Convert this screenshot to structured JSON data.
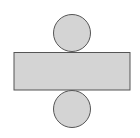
{
  "diagram": {
    "colors": {
      "fill": "#d4d4d4",
      "stroke": "#555555",
      "background": "#ffffff"
    },
    "shapes": {
      "top_circle": {
        "cx": 72,
        "cy": 33,
        "r": 18.5
      },
      "rectangle": {
        "x": 14,
        "y": 52.5,
        "width": 116,
        "height": 37.5
      },
      "bottom_circle": {
        "cx": 72,
        "cy": 109,
        "r": 18.5
      }
    }
  }
}
